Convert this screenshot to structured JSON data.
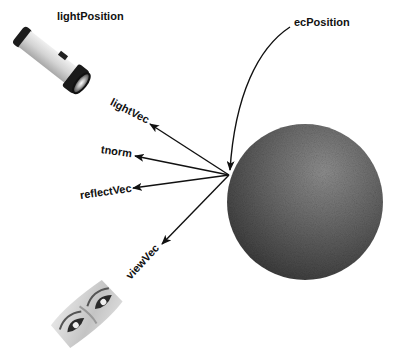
{
  "diagram": {
    "labels": {
      "light_position": "lightPosition",
      "ec_position": "ecPosition",
      "light_vec": "lightVec",
      "tnorm": "tnorm",
      "reflect_vec": "reflectVec",
      "view_vec": "viewVec"
    },
    "objects": {
      "light_source": "flashlight",
      "surface": "sphere",
      "viewer": "eyes"
    },
    "colors": {
      "arrow": "#111111",
      "sphere_light": "#8a8a8a",
      "sphere_dark": "#3c3c3c",
      "flashlight_body": "#d8d8d8",
      "flashlight_cap": "#1a1a1a"
    },
    "geometry": {
      "origin_point": [
        229,
        175
      ],
      "arrows": [
        {
          "name": "lightVec",
          "tip": [
            150,
            124
          ]
        },
        {
          "name": "tnorm",
          "tip": [
            135,
            156
          ]
        },
        {
          "name": "reflectVec",
          "tip": [
            133,
            188
          ]
        },
        {
          "name": "viewVec",
          "tip": [
            162,
            244
          ]
        }
      ],
      "sphere": {
        "cx": 305,
        "cy": 202,
        "r": 78
      }
    }
  }
}
